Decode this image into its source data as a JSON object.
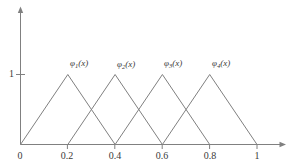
{
  "figure": {
    "background_color": "#ffffff",
    "line_color": "#808080",
    "text_color": "#3a3a3a"
  },
  "chart_data": {
    "type": "line",
    "title": "",
    "subtitle": "",
    "xlabel": "",
    "ylabel": "",
    "xlim": [
      0,
      1
    ],
    "ylim": [
      0,
      1
    ],
    "grid": false,
    "legend_position": "inline-above-peak",
    "x_tick_labels": [
      "0",
      "0.2",
      "0.4",
      "0.6",
      "0.8",
      "1"
    ],
    "x_tick_values": [
      0,
      0.2,
      0.4,
      0.6,
      0.8,
      1
    ],
    "y_tick_labels": [
      "1"
    ],
    "y_tick_values": [
      1
    ],
    "axis_arrows": {
      "x": true,
      "y": true
    },
    "series": [
      {
        "name": "φ₁(x)",
        "label_base": "φ",
        "label_sub": "1",
        "label_tail": "(x)",
        "peak_x": 0.2,
        "peak_y": 1,
        "x": [
          0,
          0.2,
          0.4
        ],
        "values": [
          0,
          1,
          0
        ]
      },
      {
        "name": "φ₂(x)",
        "label_base": "φ",
        "label_sub": "2",
        "label_tail": "(x)",
        "peak_x": 0.4,
        "peak_y": 1,
        "x": [
          0.2,
          0.4,
          0.6
        ],
        "values": [
          0,
          1,
          0
        ]
      },
      {
        "name": "φ₃(x)",
        "label_base": "φ",
        "label_sub": "3",
        "label_tail": "(x)",
        "peak_x": 0.6,
        "peak_y": 1,
        "x": [
          0.4,
          0.6,
          0.8
        ],
        "values": [
          0,
          1,
          0
        ]
      },
      {
        "name": "φ₄(x)",
        "label_base": "φ",
        "label_sub": "4",
        "label_tail": "(x)",
        "peak_x": 0.8,
        "peak_y": 1,
        "x": [
          0.6,
          0.8,
          1.0
        ],
        "values": [
          0,
          1,
          0
        ]
      }
    ]
  }
}
